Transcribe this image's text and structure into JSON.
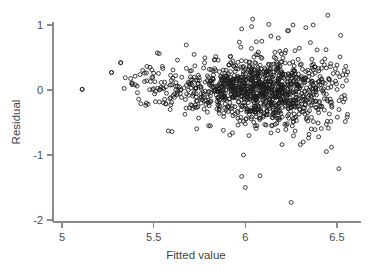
{
  "figure": {
    "background": "#ffffff",
    "axis_color": "#8a8a8a",
    "point_color": "#1c1c1c",
    "text_color": "#4a4a4a"
  },
  "chart_data": {
    "type": "scatter",
    "title": "",
    "subtitle": "",
    "xlabel": "Fitted value",
    "ylabel": "Residual",
    "xlim": [
      4.93,
      6.62
    ],
    "ylim": [
      -2.12,
      1.22
    ],
    "xticks": [
      5,
      5.5,
      6,
      6.5
    ],
    "xticklabels": [
      "5",
      "5.5",
      "6",
      "6.5"
    ],
    "yticks": [
      1,
      0,
      -1,
      -2
    ],
    "yticklabels": [
      "1",
      "0",
      "-1",
      "-2"
    ],
    "grid": false,
    "legend": null,
    "marker": "open-circle",
    "marker_size": 4,
    "n_points": 1180,
    "notable_points": [
      {
        "x": 5.11,
        "y": 0.01
      },
      {
        "x": 5.27,
        "y": 0.27
      },
      {
        "x": 5.32,
        "y": 0.42
      },
      {
        "x": 5.99,
        "y": -1.0
      },
      {
        "x": 5.98,
        "y": -1.33
      },
      {
        "x": 6.0,
        "y": -1.5
      },
      {
        "x": 6.08,
        "y": -1.32
      },
      {
        "x": 6.25,
        "y": -1.73
      },
      {
        "x": 6.51,
        "y": -1.21
      },
      {
        "x": 6.45,
        "y": 1.15
      },
      {
        "x": 6.04,
        "y": 1.09
      },
      {
        "x": 6.26,
        "y": 1.0
      }
    ]
  }
}
